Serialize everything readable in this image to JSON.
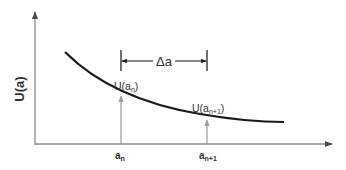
{
  "diagram": {
    "y_axis_label": "U(a)",
    "x_ticks": [
      {
        "base": "a",
        "sub": "n"
      },
      {
        "base": "a",
        "sub": "n+1"
      }
    ],
    "point_labels": [
      {
        "prefix": "U(a",
        "sub": "n",
        "suffix": ")"
      },
      {
        "prefix": "U(a",
        "sub": "n+1",
        "suffix": ")"
      }
    ],
    "interval_label": "Δa",
    "colors": {
      "curve": "#1a1a1a",
      "axes": "#8c8c8c",
      "point_arrows": "#9a9a9a",
      "interval": "#222222",
      "text": "#333333"
    }
  }
}
